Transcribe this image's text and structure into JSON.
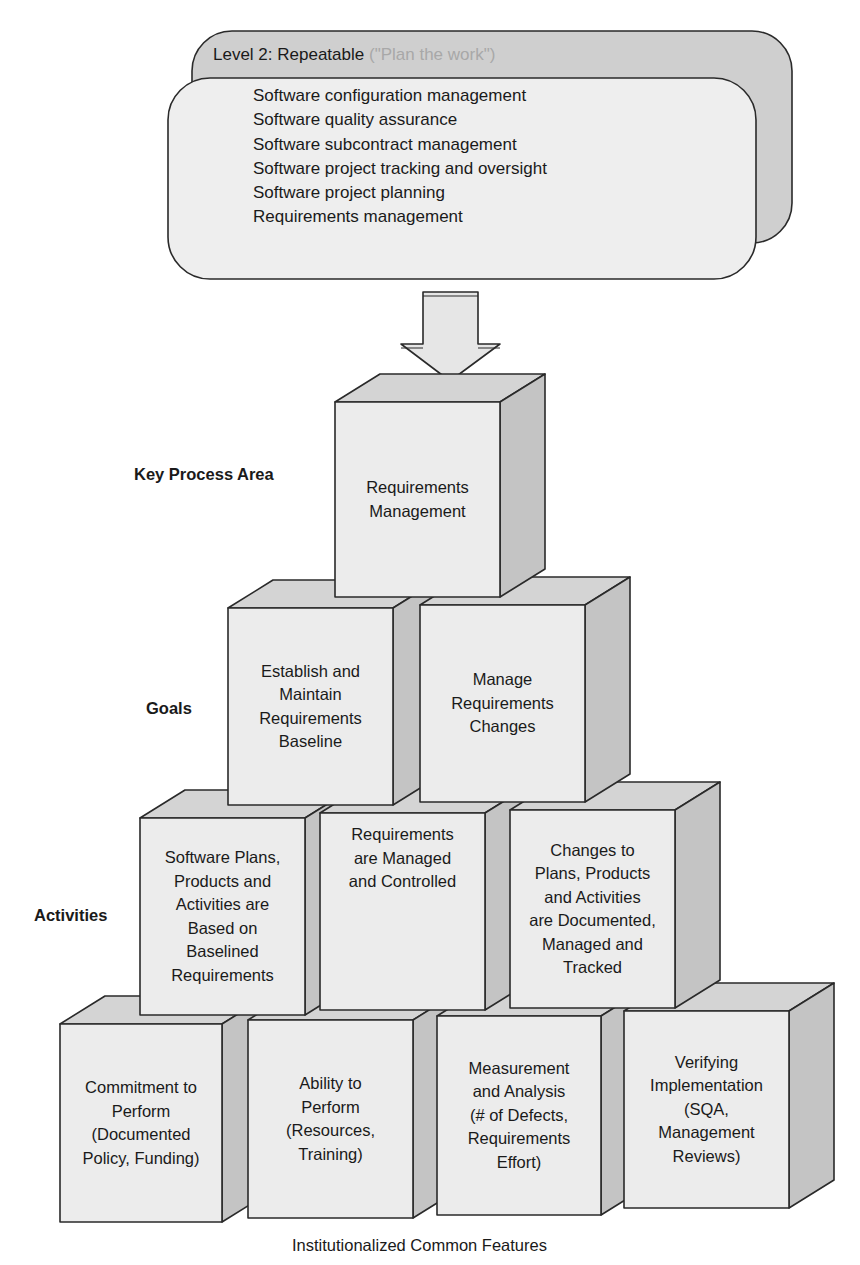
{
  "level_box": {
    "title": "Level 2: Repeatable",
    "subtitle": "(\"Plan the work\")",
    "key_process_areas": [
      "Software configuration management",
      "Software quality assurance",
      "Software subcontract management",
      "Software project tracking and oversight",
      "Software project planning",
      "Requirements management"
    ]
  },
  "arrow": {
    "direction": "down",
    "icon": "down-arrow-icon"
  },
  "row_labels": {
    "kpa": "Key Process Area",
    "goals": "Goals",
    "activities": "Activities"
  },
  "kpa_cube": {
    "lines": [
      "Requirements",
      "Management"
    ]
  },
  "goals": [
    {
      "lines": [
        "Establish and",
        "Maintain",
        "Requirements",
        "Baseline"
      ]
    },
    {
      "lines": [
        "Manage",
        "Requirements",
        "Changes"
      ]
    }
  ],
  "activities": [
    {
      "lines": [
        "Software Plans,",
        "Products and",
        "Activities are",
        "Based on",
        "Baselined",
        "Requirements"
      ]
    },
    {
      "lines": [
        "Requirements",
        "are Managed",
        "and Controlled"
      ]
    },
    {
      "lines": [
        "Changes to",
        "Plans, Products",
        "and Activities",
        "are Documented,",
        "Managed and",
        "Tracked"
      ]
    }
  ],
  "common_features": [
    {
      "lines": [
        "Commitment to",
        "Perform",
        "(Documented",
        "Policy, Funding)"
      ]
    },
    {
      "lines": [
        "Ability to",
        "Perform",
        "(Resources,",
        "Training)"
      ]
    },
    {
      "lines": [
        "Measurement",
        "and Analysis",
        "(# of Defects,",
        "Requirements",
        "Effort)"
      ]
    },
    {
      "lines": [
        "Verifying",
        "Implementation",
        "(SQA,",
        "Management",
        "Reviews)"
      ]
    }
  ],
  "caption": "Institutionalized Common Features",
  "colors": {
    "face_front": "#ececec",
    "face_top": "#d4d4d4",
    "face_side": "#c4c4c4",
    "back_panel": "#cfcfcf",
    "front_panel": "#eeeeee",
    "stroke": "#2a2a2a",
    "subtitle": "#a8a8a8"
  }
}
